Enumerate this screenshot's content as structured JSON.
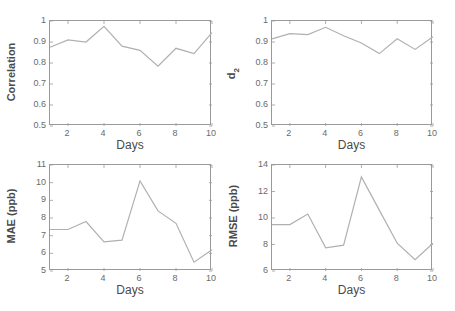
{
  "chart_data": [
    {
      "type": "line",
      "title": "",
      "xlabel": "Days",
      "ylabel": "Correlation",
      "x": [
        1,
        2,
        3,
        4,
        5,
        6,
        7,
        8,
        9,
        10
      ],
      "values": [
        0.875,
        0.91,
        0.9,
        0.975,
        0.88,
        0.86,
        0.785,
        0.87,
        0.845,
        0.945
      ],
      "xlim": [
        1,
        10
      ],
      "ylim": [
        0.5,
        1
      ],
      "xticks": [
        2,
        4,
        6,
        8,
        10
      ],
      "yticks": [
        0.5,
        0.6,
        0.7,
        0.8,
        0.9,
        1
      ],
      "ytick_labels": [
        "0.5",
        "0.6",
        "0.7",
        "0.8",
        "0.9",
        "1"
      ],
      "grid": false
    },
    {
      "type": "line",
      "title": "",
      "xlabel": "Days",
      "ylabel": "d2",
      "ylabel_main": "d",
      "ylabel_sub": "2",
      "x": [
        1,
        2,
        3,
        4,
        5,
        6,
        7,
        8,
        9,
        10
      ],
      "values": [
        0.915,
        0.94,
        0.935,
        0.97,
        0.93,
        0.895,
        0.845,
        0.915,
        0.865,
        0.925
      ],
      "xlim": [
        1,
        10
      ],
      "ylim": [
        0.5,
        1
      ],
      "xticks": [
        2,
        4,
        6,
        8,
        10
      ],
      "yticks": [
        0.5,
        0.6,
        0.7,
        0.8,
        0.9,
        1
      ],
      "ytick_labels": [
        "0.5",
        "0.6",
        "0.7",
        "0.8",
        "0.9",
        "1"
      ],
      "grid": false
    },
    {
      "type": "line",
      "title": "",
      "xlabel": "Days",
      "ylabel": "MAE (ppb)",
      "x": [
        1,
        2,
        3,
        4,
        5,
        6,
        7,
        8,
        9,
        10
      ],
      "values": [
        7.35,
        7.35,
        7.8,
        6.65,
        6.75,
        10.1,
        8.4,
        7.7,
        5.5,
        6.2
      ],
      "xlim": [
        1,
        10
      ],
      "ylim": [
        5,
        11
      ],
      "xticks": [
        2,
        4,
        6,
        8,
        10
      ],
      "yticks": [
        5,
        6,
        7,
        8,
        9,
        10,
        11
      ],
      "ytick_labels": [
        "5",
        "6",
        "7",
        "8",
        "9",
        "10",
        "11"
      ],
      "grid": false
    },
    {
      "type": "line",
      "title": "",
      "xlabel": "Days",
      "ylabel": "RMSE (ppb)",
      "x": [
        1,
        2,
        3,
        4,
        5,
        6,
        7,
        8,
        9,
        10
      ],
      "values": [
        9.5,
        9.5,
        10.3,
        7.75,
        7.95,
        13.1,
        10.6,
        8.1,
        6.85,
        8.1
      ],
      "xlim": [
        1,
        10
      ],
      "ylim": [
        6,
        14
      ],
      "xticks": [
        2,
        4,
        6,
        8,
        10
      ],
      "yticks": [
        6,
        8,
        10,
        12,
        14
      ],
      "ytick_labels": [
        "6",
        "8",
        "10",
        "12",
        "14"
      ],
      "grid": false
    }
  ],
  "style": {
    "line_color": "#b0b0b0",
    "axis_color": "#9a9a9a",
    "tick_label_color": "#6a6a6a",
    "axis_label_color": "#4a4a4a"
  }
}
